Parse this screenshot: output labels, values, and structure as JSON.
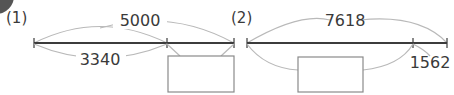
{
  "colors": {
    "line": "#3c3c3c",
    "arc": "#b9b9b9",
    "text": "#3a3a3a",
    "corner": "#555555"
  },
  "problems": [
    {
      "label": "(1)",
      "total": "5000",
      "part": "3340",
      "answer_box": ""
    },
    {
      "label": "(2)",
      "total": "7618",
      "part": "1562",
      "answer_box": ""
    }
  ]
}
